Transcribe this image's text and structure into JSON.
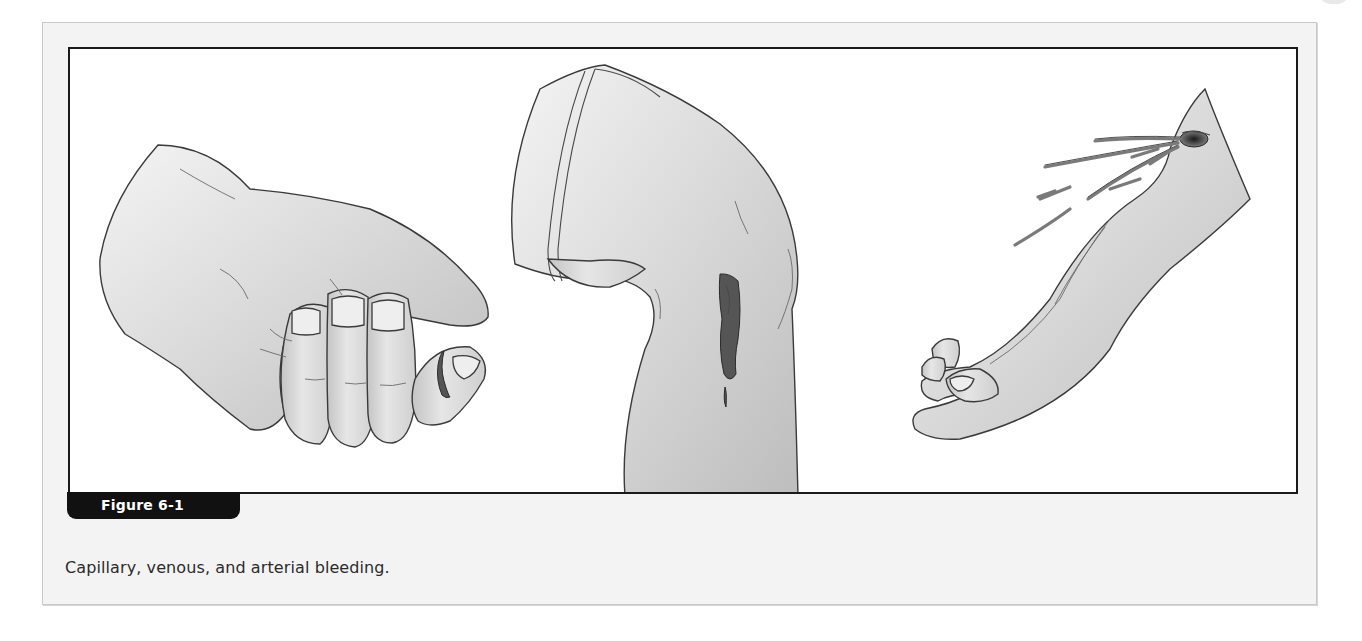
{
  "figure": {
    "label": "Figure 6-1",
    "caption": "Capillary, venous, and arterial bleeding.",
    "panels": [
      {
        "name": "capillary-bleeding",
        "subject": "hand with bleeding fingertip"
      },
      {
        "name": "venous-bleeding",
        "subject": "bent knee with steady flowing wound"
      },
      {
        "name": "arterial-bleeding",
        "subject": "forearm with spurting wound"
      }
    ],
    "colors": {
      "frame_background": "#f3f3f3",
      "art_border": "#1a1a1a",
      "tab_background": "#111111",
      "tab_text": "#ffffff",
      "caption_text": "#2b2b2b"
    }
  }
}
